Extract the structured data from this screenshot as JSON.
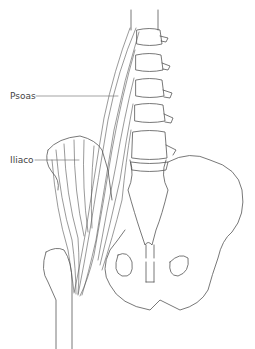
{
  "figure": {
    "labels": [
      {
        "id": "psoas",
        "text": "Psoas"
      },
      {
        "id": "iliacus",
        "text": "Iliaco"
      }
    ],
    "colors": {
      "stroke": "#555555",
      "label": "#444444",
      "background": "#ffffff"
    }
  }
}
